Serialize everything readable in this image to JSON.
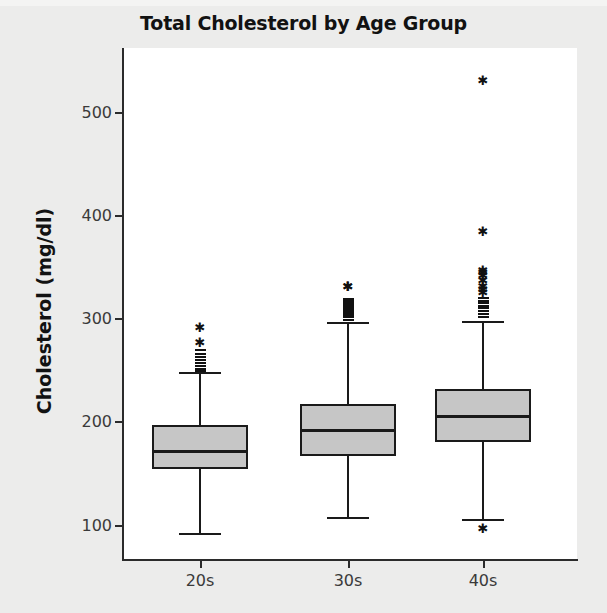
{
  "chart_data": {
    "type": "box",
    "title": "Total Cholesterol by Age Group",
    "xlabel": "",
    "ylabel": "Cholesterol (mg/dl)",
    "categories": [
      "20s",
      "30s",
      "40s"
    ],
    "ylim": [
      75,
      545
    ],
    "yticks": [
      100,
      200,
      300,
      400,
      500
    ],
    "grid": false,
    "legend": "none",
    "box_fill_color": "#c6c6c6",
    "box_line_color": "#1a1a1a",
    "plot_background": "#ffffff",
    "figure_background": "#ececeb",
    "outlier_marker": "asterisk",
    "series": [
      {
        "name": "20s",
        "whisker_low": 92,
        "q1": 154,
        "median": 172,
        "q3": 197,
        "whisker_high": 248,
        "outliers": [
          290,
          275,
          270,
          267,
          264,
          261,
          258,
          255,
          252,
          250
        ]
      },
      {
        "name": "30s",
        "whisker_low": 108,
        "q1": 167,
        "median": 192,
        "q3": 217,
        "whisker_high": 297,
        "outliers": [
          330,
          330,
          320,
          307,
          300,
          302,
          304,
          306,
          308,
          310,
          312,
          314,
          316,
          318
        ]
      },
      {
        "name": "40s",
        "whisker_low": 106,
        "q1": 180,
        "median": 206,
        "q3": 232,
        "whisker_high": 298,
        "outliers": [
          529,
          383,
          345,
          343,
          340,
          335,
          330,
          327,
          324,
          321,
          318,
          316,
          313,
          311,
          308,
          305,
          302
        ],
        "low_outliers": [
          95
        ]
      }
    ]
  },
  "axis": {
    "ytick_labels": [
      "500",
      "400",
      "300",
      "200",
      "100"
    ],
    "xtick_labels": [
      "20s",
      "30s",
      "40s"
    ]
  }
}
